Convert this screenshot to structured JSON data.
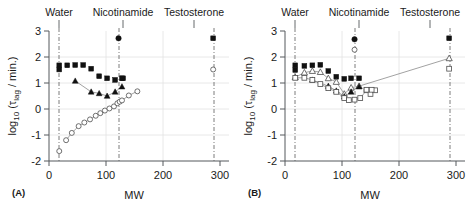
{
  "figure": {
    "panels": [
      {
        "tag": "(A)",
        "xlabel": "MW",
        "ylabel_parts": {
          "log": "log",
          "base": "10",
          "open": " (",
          "tau": "τ",
          "sub": "lag",
          "unit": " / min.)"
        },
        "ylabel_plain": "log10 (τlag / min.)",
        "xticks": [
          0,
          100,
          200,
          300
        ],
        "yticks": [
          -2,
          -1,
          0,
          1,
          2,
          3
        ],
        "xlim": [
          -10,
          320
        ],
        "ylim": [
          -2,
          3
        ],
        "reference_lines": [
          {
            "label": "Water",
            "mw": 18
          },
          {
            "label": "Nicotinamide",
            "mw": 122
          },
          {
            "label": "Testosterone",
            "mw": 288
          }
        ]
      },
      {
        "tag": "(B)",
        "xlabel": "MW",
        "ylabel_parts": {
          "log": "log",
          "base": "10",
          "open": " (",
          "tau": "τ",
          "sub": "lag",
          "unit": " / min.)"
        },
        "ylabel_plain": "log10 (τlag / min.)",
        "xticks": [
          0,
          100,
          200,
          300
        ],
        "yticks": [
          -2,
          -1,
          0,
          1,
          2,
          3
        ],
        "xlim": [
          -10,
          320
        ],
        "ylim": [
          -2,
          3
        ],
        "reference_lines": [
          {
            "label": "Water",
            "mw": 18
          },
          {
            "label": "Nicotinamide",
            "mw": 122
          },
          {
            "label": "Testosterone",
            "mw": 288
          }
        ]
      }
    ]
  },
  "chart_data": [
    {
      "id": "panel-a",
      "type": "scatter",
      "title": "",
      "xlabel": "MW",
      "ylabel": "log10 (tau_lag / min.)",
      "xlim": [
        -10,
        320
      ],
      "ylim": [
        -2,
        3
      ],
      "xticks": [
        0,
        100,
        200,
        300
      ],
      "yticks": [
        -2,
        -1,
        0,
        1,
        2,
        3
      ],
      "grid": true,
      "legend": "none",
      "annotations": [
        {
          "text": "Water",
          "x": 18,
          "type": "vertical-reference-line"
        },
        {
          "text": "Nicotinamide",
          "x": 122,
          "type": "vertical-reference-line"
        },
        {
          "text": "Testosterone",
          "x": 288,
          "type": "vertical-reference-line"
        }
      ],
      "series": [
        {
          "name": "filled-squares",
          "marker": "filled-square",
          "connected": false,
          "x": [
            18,
            32,
            46,
            60,
            74,
            88,
            102,
            116,
            130
          ],
          "y": [
            1.68,
            1.68,
            1.69,
            1.69,
            1.55,
            1.26,
            1.18,
            1.12,
            1.18
          ]
        },
        {
          "name": "filled-square-low-water",
          "marker": "filled-square",
          "connected": false,
          "x": [
            18
          ],
          "y": [
            1.52
          ]
        },
        {
          "name": "filled-squares-right",
          "marker": "filled-square",
          "connected": false,
          "x": [
            128,
            288
          ],
          "y": [
            1.18,
            2.72
          ]
        },
        {
          "name": "filled-circle-nicotinamide",
          "marker": "filled-circle",
          "connected": false,
          "x": [
            122
          ],
          "y": [
            2.72
          ]
        },
        {
          "name": "filled-triangles",
          "marker": "filled-triangle",
          "connected": true,
          "x": [
            46,
            74,
            88,
            102,
            116,
            128
          ],
          "y": [
            1.08,
            0.66,
            0.6,
            0.5,
            0.66,
            0.86
          ]
        },
        {
          "name": "open-circles",
          "marker": "open-circle",
          "connected": true,
          "x": [
            30,
            40,
            52,
            62,
            72,
            82,
            90,
            98,
            106,
            114,
            120,
            124,
            128,
            140,
            155
          ],
          "y": [
            -1.2,
            -0.92,
            -0.66,
            -0.52,
            -0.4,
            -0.26,
            -0.16,
            -0.06,
            0.02,
            0.1,
            0.22,
            0.28,
            0.33,
            0.52,
            0.68
          ]
        },
        {
          "name": "open-circle-water",
          "marker": "open-circle",
          "connected": false,
          "x": [
            18
          ],
          "y": [
            -1.62
          ]
        },
        {
          "name": "open-circle-testosterone",
          "marker": "open-circle",
          "connected": false,
          "x": [
            288
          ],
          "y": [
            1.52
          ]
        }
      ]
    },
    {
      "id": "panel-b",
      "type": "scatter",
      "title": "",
      "xlabel": "MW",
      "ylabel": "log10 (tau_lag / min.)",
      "xlim": [
        -10,
        320
      ],
      "ylim": [
        -2,
        3
      ],
      "xticks": [
        0,
        100,
        200,
        300
      ],
      "yticks": [
        -2,
        -1,
        0,
        1,
        2,
        3
      ],
      "grid": true,
      "legend": "none",
      "annotations": [
        {
          "text": "Water",
          "x": 18,
          "type": "vertical-reference-line"
        },
        {
          "text": "Nicotinamide",
          "x": 122,
          "type": "vertical-reference-line"
        },
        {
          "text": "Testosterone",
          "x": 288,
          "type": "vertical-reference-line"
        }
      ],
      "series": [
        {
          "name": "filled-squares",
          "marker": "filled-square",
          "connected": false,
          "x": [
            18,
            34,
            48,
            62,
            76,
            90,
            104,
            116,
            130
          ],
          "y": [
            1.68,
            1.66,
            1.68,
            1.7,
            1.46,
            1.24,
            1.16,
            1.18,
            1.18
          ]
        },
        {
          "name": "filled-square-low-water",
          "marker": "filled-square",
          "connected": false,
          "x": [
            18
          ],
          "y": [
            1.5
          ]
        },
        {
          "name": "filled-square-testosterone",
          "marker": "filled-square",
          "connected": false,
          "x": [
            288
          ],
          "y": [
            2.72
          ]
        },
        {
          "name": "filled-circle-nicotinamide",
          "marker": "filled-circle",
          "connected": false,
          "x": [
            122
          ],
          "y": [
            2.68
          ]
        },
        {
          "name": "open-circle-nicotinamide",
          "marker": "open-circle",
          "connected": false,
          "x": [
            122
          ],
          "y": [
            2.28
          ]
        },
        {
          "name": "open-triangles",
          "marker": "open-triangle",
          "connected": true,
          "x": [
            18,
            34,
            48,
            62,
            76,
            90,
            104,
            116,
            130,
            288
          ],
          "y": [
            1.22,
            1.4,
            1.46,
            1.42,
            1.18,
            1.04,
            0.58,
            0.82,
            0.88,
            1.95
          ]
        },
        {
          "name": "filled-triangles",
          "marker": "filled-triangle",
          "connected": true,
          "x": [
            48,
            76,
            90,
            104,
            116,
            130
          ],
          "y": [
            1.12,
            0.88,
            0.7,
            0.48,
            0.66,
            0.86
          ]
        },
        {
          "name": "open-squares",
          "marker": "open-square",
          "connected": true,
          "x": [
            18,
            34,
            48,
            62,
            76,
            90,
            104,
            112,
            122,
            132,
            143,
            150,
            158
          ],
          "y": [
            1.2,
            1.2,
            1.12,
            0.96,
            0.8,
            0.66,
            0.42,
            0.34,
            0.36,
            0.42,
            0.72,
            0.58,
            0.72
          ]
        },
        {
          "name": "open-square-testosterone",
          "marker": "open-square",
          "connected": false,
          "x": [
            288
          ],
          "y": [
            1.55
          ]
        },
        {
          "name": "open-squares-right-pair",
          "marker": "open-square",
          "connected": true,
          "x": [
            143,
            152
          ],
          "y": [
            0.74,
            0.74
          ]
        }
      ]
    }
  ],
  "colors": {
    "background": "#ffffff",
    "axis": "#55595c",
    "grid": "#e2e2e2",
    "reference_line": "#6e6e6e",
    "marker_filled": "#111111",
    "marker_open_stroke": "#4d4d4d",
    "connector": "#7a7a7a",
    "text": "#1a1a1a"
  }
}
